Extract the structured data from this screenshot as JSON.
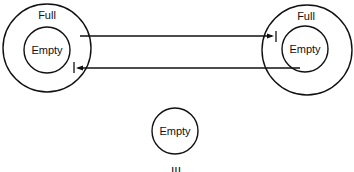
{
  "diagram": {
    "left": {
      "outer_label": "Full",
      "inner_label": "Empty"
    },
    "right": {
      "outer_label": "Full",
      "inner_label": "Empty"
    },
    "bottom": {
      "label": "Empty"
    },
    "caption": "III"
  },
  "colors": {
    "stroke": "#111111",
    "background": "#ffffff"
  }
}
